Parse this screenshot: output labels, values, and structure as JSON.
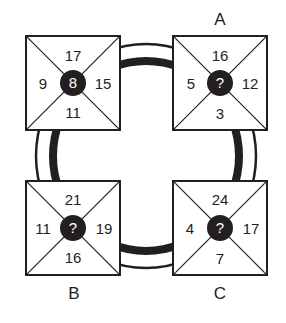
{
  "puzzle": {
    "labels": {
      "a": "A",
      "b": "B",
      "c": "C"
    },
    "boxes": {
      "top_left": {
        "top": "17",
        "left": "9",
        "right": "15",
        "bottom": "11",
        "center": "8"
      },
      "top_right": {
        "top": "16",
        "left": "5",
        "right": "12",
        "bottom": "3",
        "center": "?"
      },
      "bottom_left": {
        "top": "21",
        "left": "11",
        "right": "19",
        "bottom": "16",
        "center": "?"
      },
      "bottom_right": {
        "top": "24",
        "left": "4",
        "right": "17",
        "bottom": "7",
        "center": "?"
      }
    },
    "colors": {
      "ink": "#231f20",
      "background": "#ffffff"
    }
  }
}
